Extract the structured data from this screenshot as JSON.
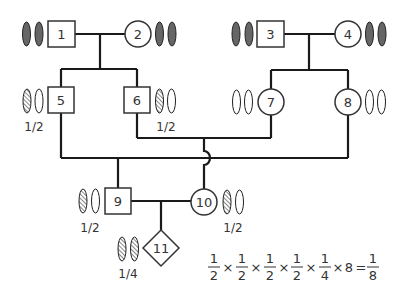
{
  "diagram": {
    "type": "pedigree",
    "colors": {
      "line": "#1a1a1a",
      "shape_stroke": "#333333",
      "chromosome_dark": "#666666",
      "chromosome_hatch": "#555555",
      "background": "#ffffff"
    },
    "individuals": [
      {
        "id": "1",
        "label": "1",
        "sex": "male",
        "chromosomes": [
          "dark",
          "dark"
        ],
        "probability": ""
      },
      {
        "id": "2",
        "label": "2",
        "sex": "female",
        "chromosomes": [
          "dark",
          "dark"
        ],
        "probability": ""
      },
      {
        "id": "3",
        "label": "3",
        "sex": "male",
        "chromosomes": [
          "dark",
          "dark"
        ],
        "probability": ""
      },
      {
        "id": "4",
        "label": "4",
        "sex": "female",
        "chromosomes": [
          "dark",
          "dark"
        ],
        "probability": ""
      },
      {
        "id": "5",
        "label": "5",
        "sex": "male",
        "chromosomes": [
          "hatched",
          "empty"
        ],
        "probability": "1/2"
      },
      {
        "id": "6",
        "label": "6",
        "sex": "male",
        "chromosomes": [
          "hatched",
          "empty"
        ],
        "probability": "1/2"
      },
      {
        "id": "7",
        "label": "7",
        "sex": "female",
        "chromosomes": [
          "empty",
          "empty"
        ],
        "probability": ""
      },
      {
        "id": "8",
        "label": "8",
        "sex": "female",
        "chromosomes": [
          "empty",
          "empty"
        ],
        "probability": ""
      },
      {
        "id": "9",
        "label": "9",
        "sex": "male",
        "chromosomes": [
          "hatched",
          "empty"
        ],
        "probability": "1/2"
      },
      {
        "id": "10",
        "label": "10",
        "sex": "female",
        "chromosomes": [
          "hatched",
          "empty"
        ],
        "probability": "1/2"
      },
      {
        "id": "11",
        "label": "11",
        "sex": "unknown",
        "chromosomes": [
          "hatched",
          "hatched"
        ],
        "probability": "1/4"
      }
    ],
    "matings": [
      {
        "partners": [
          "1",
          "2"
        ],
        "children": [
          "5",
          "6"
        ]
      },
      {
        "partners": [
          "3",
          "4"
        ],
        "children": [
          "7",
          "8"
        ]
      },
      {
        "partners": [
          "5",
          "8"
        ],
        "children": [
          "9"
        ]
      },
      {
        "partners": [
          "6",
          "7"
        ],
        "children": [
          "10"
        ]
      },
      {
        "partners": [
          "9",
          "10"
        ],
        "children": [
          "11"
        ]
      }
    ],
    "formula": {
      "terms": [
        {
          "num": "1",
          "den": "2"
        },
        {
          "num": "1",
          "den": "2"
        },
        {
          "num": "1",
          "den": "2"
        },
        {
          "num": "1",
          "den": "2"
        },
        {
          "num": "1",
          "den": "4"
        }
      ],
      "operator": "×",
      "multiplier": "8",
      "equals": "=",
      "result": {
        "num": "1",
        "den": "8"
      }
    }
  }
}
